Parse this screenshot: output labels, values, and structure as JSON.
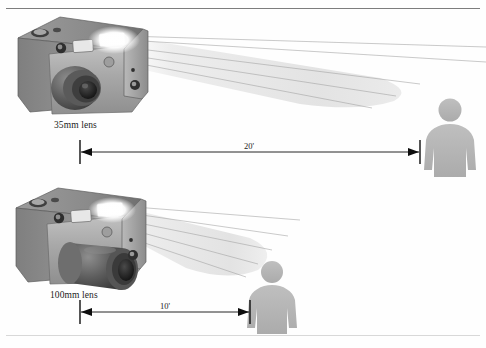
{
  "figure": {
    "top_rule": true,
    "bottom_rule": true
  },
  "panels": [
    {
      "id": "panel-35mm",
      "lens_label": "35mm lens",
      "distance_label": "20'",
      "distance_feet": 20,
      "beam_spread": "wide",
      "beam_length_px": 270,
      "subject_count": 1
    },
    {
      "id": "panel-100mm",
      "lens_label": "100mm lens",
      "distance_label": "10'",
      "distance_feet": 10,
      "beam_spread": "narrow",
      "beam_length_px": 150,
      "subject_count": 1
    }
  ],
  "colors": {
    "camera_body_light": "#b4b4b4",
    "camera_body_mid": "#969696",
    "camera_body_dark": "#6b6b6b",
    "camera_top": "#8d8d8d",
    "lens_dark": "#3c3c3c",
    "lens_mid": "#5f5f5f",
    "beam": "#e3e3e3",
    "beam_line": "#9a9a9a",
    "person": "#b6b6b6",
    "dimension_line": "#0d0d0d",
    "rule_top": "#7d7d7d",
    "rule_bottom": "#d8d8d8",
    "text": "#1b1b1b",
    "flash_glow": "#ffffff"
  },
  "icons": {
    "person": "person-silhouette-icon",
    "camera": "camera-icon",
    "flash": "flash-glow-icon",
    "arrow_left": "arrow-left-icon",
    "arrow_right": "arrow-right-icon"
  }
}
